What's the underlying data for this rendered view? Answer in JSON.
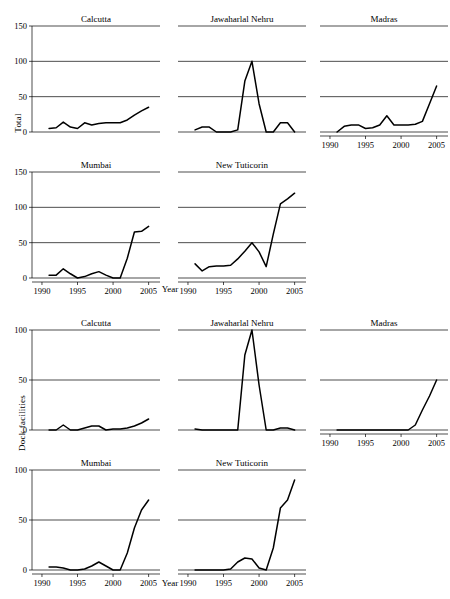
{
  "figure": {
    "xlabel": "Year",
    "x_ticks": [
      1990,
      1995,
      2000,
      2005
    ],
    "xlim": [
      1988.6,
      2006.6
    ]
  },
  "blocks": [
    {
      "id": "total",
      "ylabel": "Total",
      "ylim": [
        0,
        150
      ],
      "y_ticks": [
        0,
        50,
        100,
        150
      ]
    },
    {
      "id": "dock",
      "ylabel": "Dock facilities",
      "ylim": [
        0,
        100
      ],
      "y_ticks": [
        0,
        50,
        100
      ]
    }
  ],
  "chart_data": [
    {
      "type": "line",
      "title": "Calcutta",
      "group": "Total",
      "xlabel": "Year",
      "ylabel": "Total",
      "xlim": [
        1988.6,
        2006.6
      ],
      "ylim": [
        0,
        150
      ],
      "x_ticks": [
        1990,
        1995,
        2000,
        2005
      ],
      "y_ticks": [
        0,
        50,
        100,
        150
      ],
      "grid": true,
      "x": [
        1991,
        1992,
        1993,
        1994,
        1995,
        1996,
        1997,
        1998,
        1999,
        2000,
        2001,
        2002,
        2003,
        2004,
        2005
      ],
      "values": [
        5,
        6,
        14,
        7,
        5,
        13,
        10,
        12,
        13,
        13,
        13,
        17,
        24,
        30,
        35
      ]
    },
    {
      "type": "line",
      "title": "Jawaharlal Nehru",
      "group": "Total",
      "xlabel": "Year",
      "ylabel": "Total",
      "xlim": [
        1988.6,
        2006.6
      ],
      "ylim": [
        0,
        150
      ],
      "x_ticks": [
        1990,
        1995,
        2000,
        2005
      ],
      "y_ticks": [
        0,
        50,
        100,
        150
      ],
      "grid": true,
      "x": [
        1991,
        1992,
        1993,
        1994,
        1995,
        1996,
        1997,
        1998,
        1999,
        2000,
        2001,
        2002,
        2003,
        2004,
        2005
      ],
      "values": [
        3,
        7,
        7,
        0,
        0,
        0,
        3,
        72,
        100,
        40,
        0,
        0,
        13,
        13,
        0
      ]
    },
    {
      "type": "line",
      "title": "Madras",
      "group": "Total",
      "xlabel": "Year",
      "ylabel": "Total",
      "xlim": [
        1988.6,
        2006.6
      ],
      "ylim": [
        0,
        150
      ],
      "x_ticks": [
        1990,
        1995,
        2000,
        2005
      ],
      "y_ticks": [
        0,
        50,
        100,
        150
      ],
      "grid": true,
      "x": [
        1991,
        1992,
        1993,
        1994,
        1995,
        1996,
        1997,
        1998,
        1999,
        2000,
        2001,
        2002,
        2003,
        2004,
        2005
      ],
      "values": [
        0,
        8,
        10,
        10,
        5,
        6,
        10,
        23,
        10,
        10,
        10,
        11,
        15,
        40,
        65
      ]
    },
    {
      "type": "line",
      "title": "Mumbai",
      "group": "Total",
      "xlabel": "Year",
      "ylabel": "Total",
      "xlim": [
        1988.6,
        2006.6
      ],
      "ylim": [
        0,
        150
      ],
      "x_ticks": [
        1990,
        1995,
        2000,
        2005
      ],
      "y_ticks": [
        0,
        50,
        100,
        150
      ],
      "grid": true,
      "x": [
        1991,
        1992,
        1993,
        1994,
        1995,
        1996,
        1997,
        1998,
        1999,
        2000,
        2001,
        2002,
        2003,
        2004,
        2005
      ],
      "values": [
        4,
        4,
        13,
        6,
        0,
        2,
        6,
        9,
        4,
        0,
        0,
        28,
        65,
        66,
        73
      ]
    },
    {
      "type": "line",
      "title": "New Tuticorin",
      "group": "Total",
      "xlabel": "Year",
      "ylabel": "Total",
      "xlim": [
        1988.6,
        2006.6
      ],
      "ylim": [
        0,
        150
      ],
      "x_ticks": [
        1990,
        1995,
        2000,
        2005
      ],
      "y_ticks": [
        0,
        50,
        100,
        150
      ],
      "grid": true,
      "x": [
        1991,
        1992,
        1993,
        1994,
        1995,
        1996,
        1997,
        1998,
        1999,
        2000,
        2001,
        2002,
        2003,
        2004,
        2005
      ],
      "values": [
        20,
        10,
        16,
        17,
        17,
        18,
        27,
        38,
        50,
        37,
        16,
        62,
        105,
        112,
        120
      ]
    },
    {
      "type": "line",
      "title": "Calcutta",
      "group": "Dock facilities",
      "xlabel": "Year",
      "ylabel": "Dock facilities",
      "xlim": [
        1988.6,
        2006.6
      ],
      "ylim": [
        0,
        100
      ],
      "x_ticks": [
        1990,
        1995,
        2000,
        2005
      ],
      "y_ticks": [
        0,
        50,
        100
      ],
      "grid": true,
      "x": [
        1991,
        1992,
        1993,
        1994,
        1995,
        1996,
        1997,
        1998,
        1999,
        2000,
        2001,
        2002,
        2003,
        2004,
        2005
      ],
      "values": [
        0,
        0,
        5,
        0,
        0,
        2,
        4,
        4,
        0,
        1,
        1,
        2,
        4,
        7,
        11
      ]
    },
    {
      "type": "line",
      "title": "Jawaharlal Nehru",
      "group": "Dock facilities",
      "xlabel": "Year",
      "ylabel": "Dock facilities",
      "xlim": [
        1988.6,
        2006.6
      ],
      "ylim": [
        0,
        100
      ],
      "x_ticks": [
        1990,
        1995,
        2000,
        2005
      ],
      "y_ticks": [
        0,
        50,
        100
      ],
      "grid": true,
      "x": [
        1991,
        1992,
        1993,
        1994,
        1995,
        1996,
        1997,
        1998,
        1999,
        2000,
        2001,
        2002,
        2003,
        2004,
        2005
      ],
      "values": [
        1,
        0,
        0,
        0,
        0,
        0,
        0,
        75,
        100,
        45,
        0,
        0,
        2,
        2,
        0
      ]
    },
    {
      "type": "line",
      "title": "Madras",
      "group": "Dock facilities",
      "xlabel": "Year",
      "ylabel": "Dock facilities",
      "xlim": [
        1988.6,
        2006.6
      ],
      "ylim": [
        0,
        100
      ],
      "x_ticks": [
        1990,
        1995,
        2000,
        2005
      ],
      "y_ticks": [
        0,
        50,
        100
      ],
      "grid": true,
      "x": [
        1991,
        1992,
        1993,
        1994,
        1995,
        1996,
        1997,
        1998,
        1999,
        2000,
        2001,
        2002,
        2003,
        2004,
        2005
      ],
      "values": [
        0,
        0,
        0,
        0,
        0,
        0,
        0,
        0,
        0,
        0,
        0,
        5,
        20,
        34,
        50
      ]
    },
    {
      "type": "line",
      "title": "Mumbai",
      "group": "Dock facilities",
      "xlabel": "Year",
      "ylabel": "Dock facilities",
      "xlim": [
        1988.6,
        2006.6
      ],
      "ylim": [
        0,
        100
      ],
      "x_ticks": [
        1990,
        1995,
        2000,
        2005
      ],
      "y_ticks": [
        0,
        50,
        100
      ],
      "grid": true,
      "x": [
        1991,
        1992,
        1993,
        1994,
        1995,
        1996,
        1997,
        1998,
        1999,
        2000,
        2001,
        2002,
        2003,
        2004,
        2005
      ],
      "values": [
        3,
        3,
        2,
        0,
        0,
        1,
        4,
        8,
        4,
        0,
        0,
        17,
        42,
        60,
        70
      ]
    },
    {
      "type": "line",
      "title": "New Tuticorin",
      "group": "Dock facilities",
      "xlabel": "Year",
      "ylabel": "Dock facilities",
      "xlim": [
        1988.6,
        2006.6
      ],
      "ylim": [
        0,
        100
      ],
      "x_ticks": [
        1990,
        1995,
        2000,
        2005
      ],
      "y_ticks": [
        0,
        50,
        100
      ],
      "grid": true,
      "x": [
        1991,
        1992,
        1993,
        1994,
        1995,
        1996,
        1997,
        1998,
        1999,
        2000,
        2001,
        2002,
        2003,
        2004,
        2005
      ],
      "values": [
        0,
        0,
        0,
        0,
        0,
        1,
        8,
        12,
        11,
        2,
        0,
        22,
        62,
        70,
        90
      ]
    }
  ]
}
